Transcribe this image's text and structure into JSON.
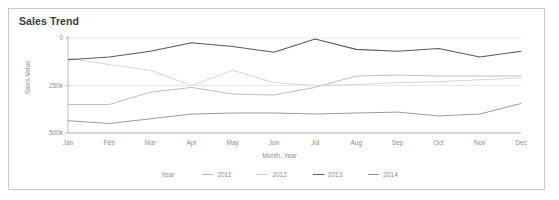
{
  "card": {
    "title": "Sales Trend"
  },
  "axes": {
    "x_title": "Month, Year",
    "y_title": "Sales Value",
    "y_ticks": [
      "500k",
      "250k",
      "0"
    ],
    "x_ticks": [
      "Jan",
      "Feb",
      "Mar",
      "Apr",
      "May",
      "Jun",
      "Jul",
      "Aug",
      "Sep",
      "Oct",
      "Nov",
      "Dec"
    ]
  },
  "legend": {
    "title": "Year",
    "items": [
      {
        "label": "2011",
        "color": "#b6b6b6"
      },
      {
        "label": "2012",
        "color": "#cfcfcf"
      },
      {
        "label": "2013",
        "color": "#5a5a5a"
      },
      {
        "label": "2014",
        "color": "#8e8e8e"
      }
    ]
  },
  "colors": {
    "card_border": "#c9c9c9",
    "grid": "#e8e8e8",
    "axis": "#bdbdbd",
    "title_text": "#3b3b3b",
    "label_text": "#8d8d8d"
  },
  "chart_data": {
    "type": "line",
    "title": "Sales Trend",
    "xlabel": "Month, Year",
    "ylabel": "Sales Value",
    "categories": [
      "Jan",
      "Feb",
      "Mar",
      "Apr",
      "May",
      "Jun",
      "Jul",
      "Aug",
      "Sep",
      "Oct",
      "Nov",
      "Dec"
    ],
    "ylim": [
      0,
      500000
    ],
    "yticks": [
      0,
      250000,
      500000
    ],
    "grid": true,
    "legend_position": "bottom",
    "legend_title": "Year",
    "series": [
      {
        "name": "2011",
        "color": "#b6b6b6",
        "values": [
          150000,
          150000,
          215000,
          240000,
          205000,
          200000,
          240000,
          300000,
          305000,
          300000,
          300000,
          300000
        ]
      },
      {
        "name": "2012",
        "color": "#cfcfcf",
        "values": [
          395000,
          360000,
          330000,
          250000,
          330000,
          265000,
          250000,
          255000,
          265000,
          270000,
          280000,
          290000
        ]
      },
      {
        "name": "2013",
        "color": "#5a5a5a",
        "values": [
          385000,
          400000,
          430000,
          475000,
          455000,
          425000,
          495000,
          440000,
          430000,
          445000,
          400000,
          430000
        ]
      },
      {
        "name": "2014",
        "color": "#8e8e8e",
        "values": [
          65000,
          50000,
          75000,
          100000,
          105000,
          105000,
          100000,
          105000,
          110000,
          90000,
          100000,
          155000
        ]
      }
    ]
  }
}
